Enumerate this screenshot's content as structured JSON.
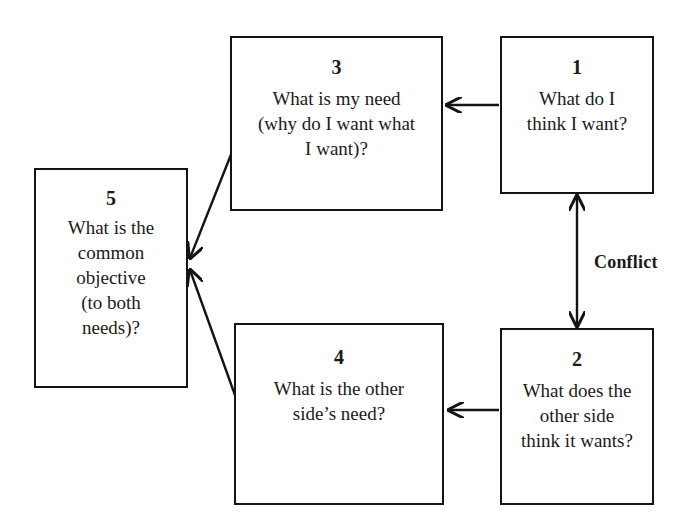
{
  "diagram": {
    "background_color": "#ffffff",
    "line_color": "#141414",
    "nodes": [
      {
        "id": "node-1",
        "number": "1",
        "text": "What do I\nthink I want?"
      },
      {
        "id": "node-2",
        "number": "2",
        "text": "What does the\nother side\nthink it wants?"
      },
      {
        "id": "node-3",
        "number": "3",
        "text": "What is my need\n(why do I want what\nI want)?"
      },
      {
        "id": "node-4",
        "number": "4",
        "text": "What is the other\nside’s need?"
      },
      {
        "id": "node-5",
        "number": "5",
        "text": "What is the\ncommon\nobjective\n(to both\nneeds)?"
      }
    ],
    "labels": {
      "conflict": "Conflict"
    },
    "edges": [
      {
        "name": "edge-1-to-3",
        "from": "node-1",
        "to": "node-3",
        "style": "arrow-left"
      },
      {
        "name": "edge-2-to-4",
        "from": "node-2",
        "to": "node-4",
        "style": "arrow-left"
      },
      {
        "name": "edge-1-to-2-conflict",
        "from": "node-1",
        "to": "node-2",
        "style": "double-arrow-vertical"
      },
      {
        "name": "edge-3-to-5",
        "from": "node-3",
        "to": "node-5",
        "style": "arrow-diagonal"
      },
      {
        "name": "edge-4-to-5",
        "from": "node-4",
        "to": "node-5",
        "style": "arrow-diagonal"
      }
    ]
  }
}
